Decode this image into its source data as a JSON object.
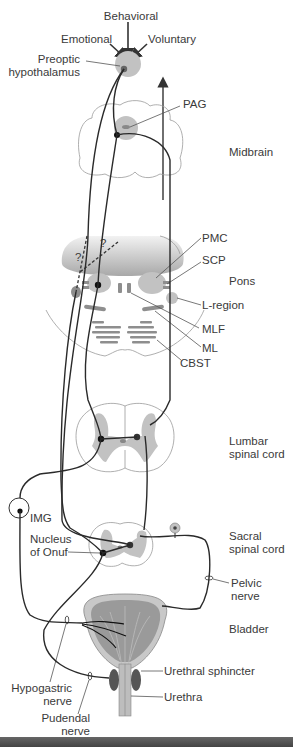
{
  "diagram": {
    "inputs": {
      "behavioral": "Behavioral",
      "emotional": "Emotional",
      "voluntary": "Voluntary"
    },
    "structures": {
      "preoptic_line1": "Preoptic",
      "preoptic_line2": "hypothalamus",
      "pag": "PAG",
      "pmc": "PMC",
      "scp": "SCP",
      "l_region": "L-region",
      "mlf": "MLF",
      "ml": "ML",
      "cbst": "CBST",
      "img": "IMG",
      "onuf_line1": "Nucleus",
      "onuf_line2": "of Onuf",
      "question1": "?",
      "question2": "?"
    },
    "regions": {
      "midbrain": "Midbrain",
      "pons": "Pons",
      "lumbar_line1": "Lumbar",
      "lumbar_line2": "spinal cord",
      "sacral_line1": "Sacral",
      "sacral_line2": "spinal cord",
      "bladder": "Bladder"
    },
    "peripheral": {
      "pelvic_line1": "Pelvic",
      "pelvic_line2": "nerve",
      "hypogastric_line1": "Hypogastric",
      "hypogastric_line2": "nerve",
      "pudendal_line1": "Pudendal",
      "pudendal_line2": "nerve",
      "urethral_sphincter": "Urethral sphincter",
      "urethra": "Urethra"
    },
    "colors": {
      "nucleus_gray": "#c2c2c2",
      "tract_gray": "#8e8e8e",
      "nerve_line": "#2a2a2a",
      "text": "#3a3a3a"
    }
  }
}
